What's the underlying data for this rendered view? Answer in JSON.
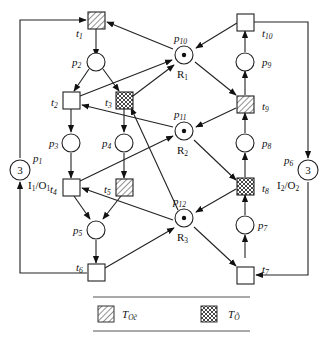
{
  "diagram": {
    "type": "petri-net",
    "places": [
      {
        "id": "p1",
        "label": "p",
        "sub": "1",
        "tokens": "3",
        "note": "I",
        "note_sub1": "1",
        "note_mid": "/O",
        "note_sub2": "1"
      },
      {
        "id": "p2",
        "label": "p",
        "sub": "2"
      },
      {
        "id": "p3",
        "label": "p",
        "sub": "3"
      },
      {
        "id": "p4",
        "label": "p",
        "sub": "4"
      },
      {
        "id": "p5",
        "label": "p",
        "sub": "5"
      },
      {
        "id": "p6",
        "label": "p",
        "sub": "6",
        "tokens": "3",
        "note": "I",
        "note_sub1": "2",
        "note_mid": "/O",
        "note_sub2": "2"
      },
      {
        "id": "p7",
        "label": "p",
        "sub": "7"
      },
      {
        "id": "p8",
        "label": "p",
        "sub": "8"
      },
      {
        "id": "p9",
        "label": "p",
        "sub": "9"
      },
      {
        "id": "p10",
        "label": "p",
        "sub": "10",
        "resource": "R",
        "resource_sub": "1"
      },
      {
        "id": "p11",
        "label": "p",
        "sub": "11",
        "resource": "R",
        "resource_sub": "2"
      },
      {
        "id": "p12",
        "label": "p",
        "sub": "12",
        "resource": "R",
        "resource_sub": "3"
      }
    ],
    "transitions": [
      {
        "id": "t1",
        "label": "t",
        "sub": "1",
        "fill": "hatched"
      },
      {
        "id": "t2",
        "label": "t",
        "sub": "2",
        "fill": "plain"
      },
      {
        "id": "t3",
        "label": "t",
        "sub": "3",
        "fill": "crosshatched"
      },
      {
        "id": "t4",
        "label": "t",
        "sub": "4",
        "fill": "plain"
      },
      {
        "id": "t5",
        "label": "t",
        "sub": "5",
        "fill": "hatched"
      },
      {
        "id": "t6",
        "label": "t",
        "sub": "6",
        "fill": "plain"
      },
      {
        "id": "t7",
        "label": "t",
        "sub": "7",
        "fill": "plain"
      },
      {
        "id": "t8",
        "label": "t",
        "sub": "8",
        "fill": "crosshatched"
      },
      {
        "id": "t9",
        "label": "t",
        "sub": "9",
        "fill": "hatched"
      },
      {
        "id": "t10",
        "label": "t",
        "sub": "10",
        "fill": "plain"
      }
    ],
    "legend": [
      {
        "pattern": "hatched",
        "label": "T",
        "sub": "Oc̃"
      },
      {
        "pattern": "crosshatched",
        "label": "T",
        "sub": "Õ"
      }
    ]
  }
}
